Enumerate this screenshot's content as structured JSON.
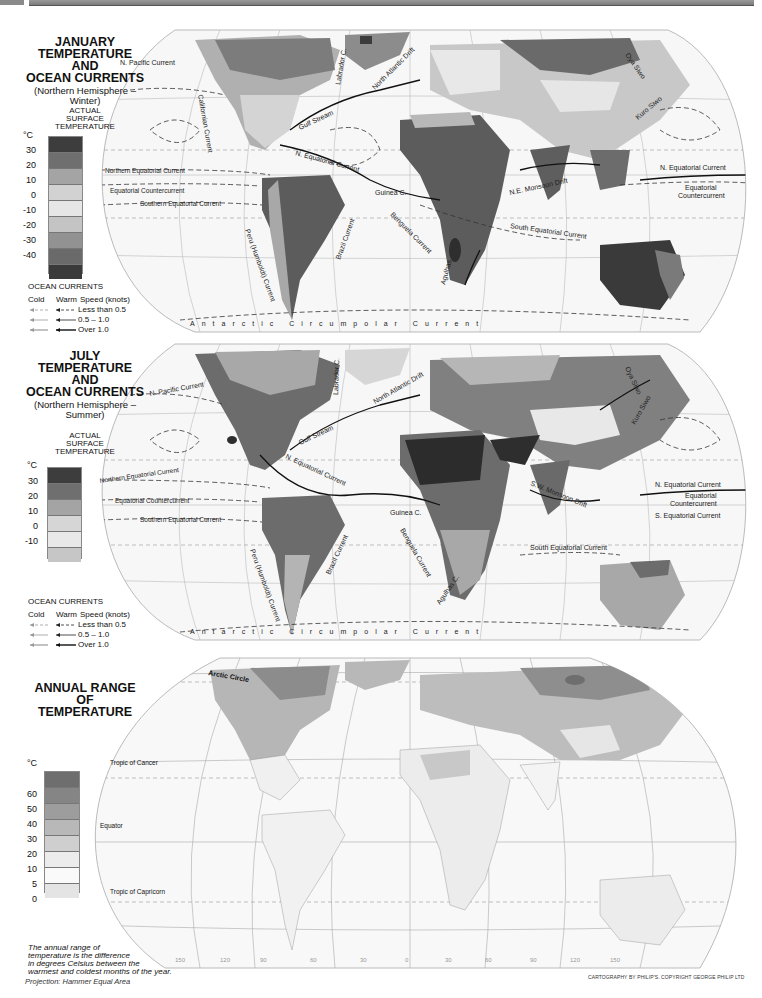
{
  "page": {
    "projection": "Projection: Hammer Equal Area",
    "credit": "CARTOGRAPHY BY PHILIP'S. COPYRIGHT GEORGE PHILIP LTD"
  },
  "january": {
    "title_lines": [
      "JANUARY",
      "TEMPERATURE",
      "AND",
      "OCEAN CURRENTS"
    ],
    "subtitle_lines": [
      "(Northern Hemisphere –",
      "Winter)"
    ],
    "scale_heading_lines": [
      "ACTUAL",
      "SURFACE",
      "TEMPERATURE"
    ],
    "unit": "°C",
    "ticks": [
      "30",
      "20",
      "10",
      "0",
      "-10",
      "-20",
      "-30",
      "-40"
    ],
    "swatch_colors": [
      "#3d3d3d",
      "#6f6f6f",
      "#a4a4a4",
      "#d2d2d2",
      "#e6e6e6",
      "#c4c4c4",
      "#929292",
      "#6a6a6a",
      "#3a3a3a"
    ],
    "ocean_currents": {
      "heading": "OCEAN CURRENTS",
      "columns": [
        "Cold",
        "Warm",
        "Speed (knots)"
      ],
      "speeds": [
        "Less than 0.5",
        "0.5 – 1.0",
        "Over 1.0"
      ]
    },
    "current_labels": [
      "N. Pacific Current",
      "Californian Current",
      "Labrador C.",
      "North Atlantic Drift",
      "Gulf Stream",
      "N. Equatorial Current",
      "Northern Equatorial Current",
      "Equatorial Countercurrent",
      "Southern Equatorial Current",
      "Peru (Humboldt) Current",
      "Brazil Current",
      "Guinea C.",
      "Benguela Current",
      "Agulhas",
      "N.E. Monsoon Drift",
      "South Equatorial Current",
      "Oya Siwo",
      "Kuro Siwo",
      "N. Equatorial Current",
      "Equatorial Countercurrent",
      "Antarctic Circumpolar Current"
    ],
    "graticule_labels": [
      "150",
      "120",
      "90",
      "60",
      "30",
      "0",
      "30",
      "60",
      "90",
      "120",
      "150"
    ]
  },
  "july": {
    "title_lines": [
      "JULY",
      "TEMPERATURE",
      "AND",
      "OCEAN CURRENTS"
    ],
    "subtitle_lines": [
      "(Northern Hemisphere –",
      "Summer)"
    ],
    "scale_heading_lines": [
      "ACTUAL",
      "SURFACE",
      "TEMPERATURE"
    ],
    "unit": "°C",
    "ticks": [
      "30",
      "20",
      "10",
      "0",
      "-10"
    ],
    "swatch_colors": [
      "#3d3d3d",
      "#6f6f6f",
      "#a4a4a4",
      "#d6d6d6",
      "#e8e8e8",
      "#c6c6c6"
    ],
    "ocean_currents": {
      "heading": "OCEAN CURRENTS",
      "columns": [
        "Cold",
        "Warm",
        "Speed (knots)"
      ],
      "speeds": [
        "Less than 0.5",
        "0.5 – 1.0",
        "Over 1.0"
      ]
    },
    "current_labels": [
      "N. Pacific Current",
      "Labrador C.",
      "North Atlantic Drift",
      "Gulf Stream",
      "N. Equatorial Current",
      "Northern Equatorial Current",
      "Equatorial Countercurrent",
      "Southern Equatorial Current",
      "Peru (Humboldt) Current",
      "Brazil Current",
      "Guinea C.",
      "Benguela Current",
      "Agulhas C.",
      "S.W. Monsoon Drift",
      "South Equatorial Current",
      "Oya Siwo",
      "Kuro Siwo",
      "N. Equatorial Current",
      "Equatorial Countercurrent",
      "S. Equatorial Current",
      "Antarctic Circumpolar Current"
    ]
  },
  "annual": {
    "title_lines": [
      "ANNUAL RANGE",
      "OF",
      "TEMPERATURE"
    ],
    "unit": "°C",
    "ticks": [
      "60",
      "50",
      "40",
      "30",
      "20",
      "10",
      "5",
      "0"
    ],
    "swatch_colors": [
      "#6e6e6e",
      "#858585",
      "#9d9d9d",
      "#b8b8b8",
      "#cfcfcf",
      "#ececec",
      "#fafafa",
      "#e4e4e4"
    ],
    "lines": [
      "Arctic Circle",
      "Tropic of Cancer",
      "Equator",
      "Tropic of Capricorn"
    ],
    "note_lines": [
      "The annual range of",
      "temperature is the difference",
      "in degrees Celsius between the",
      "warmest and coldest months of the year."
    ],
    "lat_labels": [
      "60",
      "30",
      "0",
      "30"
    ],
    "lon_labels": [
      "150",
      "120",
      "90",
      "60",
      "30",
      "0",
      "30",
      "60",
      "90",
      "120",
      "150"
    ]
  }
}
